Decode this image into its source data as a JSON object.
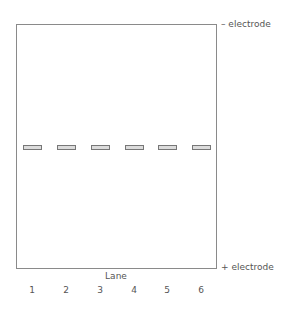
{
  "diagram": {
    "type": "gel electrophoresis",
    "top_electrode_label": "– electrode",
    "bottom_electrode_label": "+ electrode",
    "lane_axis_label": "Lane",
    "lanes": [
      {
        "label": "1",
        "band_count": 1,
        "band_position": "middle"
      },
      {
        "label": "2",
        "band_count": 1,
        "band_position": "middle"
      },
      {
        "label": "3",
        "band_count": 1,
        "band_position": "middle"
      },
      {
        "label": "4",
        "band_count": 1,
        "band_position": "middle"
      },
      {
        "label": "5",
        "band_count": 1,
        "band_position": "middle"
      },
      {
        "label": "6",
        "band_count": 1,
        "band_position": "middle"
      }
    ],
    "colors": {
      "gel_border": "#8a8a8a",
      "band_fill": "#dcdcdc",
      "band_border": "#777777",
      "text": "#555555"
    }
  }
}
